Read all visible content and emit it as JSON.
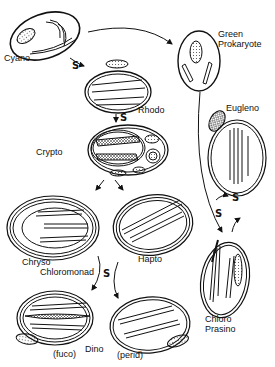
{
  "diagram": {
    "type": "plastid-endosymbiosis-evolution",
    "organisms": [
      {
        "id": "cyano",
        "label": "Cyano"
      },
      {
        "id": "green-prokaryote",
        "label_line1": "Green",
        "label_line2": "Prokaryote"
      },
      {
        "id": "rhodo",
        "label": "Rhodo"
      },
      {
        "id": "crypto",
        "label": "Crypto"
      },
      {
        "id": "eugleno",
        "label": "Eugleno"
      },
      {
        "id": "chryso",
        "label_line1": "Chryso",
        "label_line2": "Chloromonad"
      },
      {
        "id": "hapto",
        "label": "Hapto"
      },
      {
        "id": "chloro",
        "label_line1": "Chloro",
        "label_line2": "Prasino"
      },
      {
        "id": "dino-fuco",
        "label": "(fuco)"
      },
      {
        "id": "dino",
        "label": "Dino"
      },
      {
        "id": "dino-perid",
        "label": "(perid)"
      }
    ],
    "symbiosis_marker": "S",
    "arrows": [
      {
        "from": "cyano",
        "to": "green-prokaryote"
      },
      {
        "from": "cyano",
        "to": "rhodo",
        "marker": "S"
      },
      {
        "from": "rhodo",
        "to": "crypto",
        "marker": "S"
      },
      {
        "from": "crypto",
        "to": "chryso"
      },
      {
        "from": "crypto",
        "to": "hapto"
      },
      {
        "from": "green-prokaryote",
        "to": "chloro",
        "marker": "S"
      },
      {
        "from": "chloro",
        "to": "eugleno",
        "marker": "S"
      },
      {
        "from": "chryso",
        "to": "dino-fuco",
        "marker": "S"
      },
      {
        "from": "hapto",
        "to": "dino-perid"
      }
    ]
  }
}
